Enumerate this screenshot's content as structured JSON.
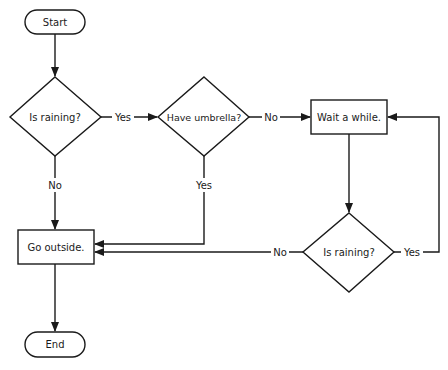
{
  "diagram": {
    "type": "flowchart",
    "nodes": {
      "start": {
        "label": "Start",
        "shape": "terminator"
      },
      "is_raining_1": {
        "label": "Is raining?",
        "shape": "decision"
      },
      "have_umbrella": {
        "label": "Have umbrella?",
        "shape": "decision"
      },
      "wait": {
        "label": "Wait a while.",
        "shape": "process"
      },
      "is_raining_2": {
        "label": "Is raining?",
        "shape": "decision"
      },
      "go_outside": {
        "label": "Go outside.",
        "shape": "process"
      },
      "end": {
        "label": "End",
        "shape": "terminator"
      }
    },
    "edges": {
      "raining1_yes": {
        "label": "Yes",
        "from": "is_raining_1",
        "to": "have_umbrella"
      },
      "raining1_no": {
        "label": "No",
        "from": "is_raining_1",
        "to": "go_outside"
      },
      "umbrella_no": {
        "label": "No",
        "from": "have_umbrella",
        "to": "wait"
      },
      "umbrella_yes": {
        "label": "Yes",
        "from": "have_umbrella",
        "to": "go_outside"
      },
      "raining2_no": {
        "label": "No",
        "from": "is_raining_2",
        "to": "go_outside"
      },
      "raining2_yes": {
        "label": "Yes",
        "from": "is_raining_2",
        "to": "wait"
      }
    },
    "colors": {
      "stroke": "#1a1a1a",
      "fill": "#ffffff"
    }
  }
}
